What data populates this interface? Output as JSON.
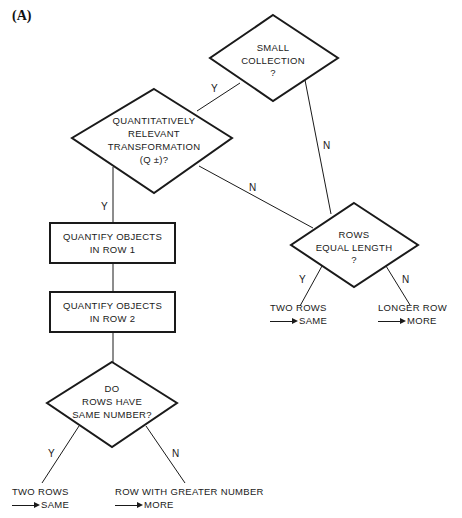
{
  "panel_label": "(A)",
  "nodes": {
    "small_collection": {
      "lines": [
        "SMALL",
        "COLLECTION",
        "?"
      ]
    },
    "quant_relevant": {
      "lines": [
        "QUANTITATIVELY",
        "RELEVANT",
        "TRANSFORMATION",
        "(Q ±)?"
      ]
    },
    "rows_equal": {
      "lines": [
        "ROWS",
        "EQUAL LENGTH",
        "?"
      ]
    },
    "quantify_row1": {
      "lines": [
        "QUANTIFY OBJECTS",
        "IN ROW 1"
      ]
    },
    "quantify_row2": {
      "lines": [
        "QUANTIFY OBJECTS",
        "IN ROW 2"
      ]
    },
    "same_number": {
      "lines": [
        "DO",
        "ROWS HAVE",
        "SAME NUMBER?"
      ]
    }
  },
  "edges": {
    "small_to_quant": "Y",
    "small_to_rows_equal": "N",
    "quant_to_row1": "Y",
    "quant_to_rows_equal": "N",
    "rows_equal_yes": "Y",
    "rows_equal_no": "N",
    "same_number_yes": "Y",
    "same_number_no": "N"
  },
  "outcomes": {
    "rows_equal_yes": {
      "line1": "TWO ROWS",
      "line2": "SAME"
    },
    "rows_equal_no": {
      "line1": "LONGER ROW",
      "line2": "MORE"
    },
    "same_number_yes": {
      "line1": "TWO ROWS",
      "line2": "SAME"
    },
    "same_number_no": {
      "line1": "ROW WITH GREATER NUMBER",
      "line2": "MORE"
    }
  }
}
